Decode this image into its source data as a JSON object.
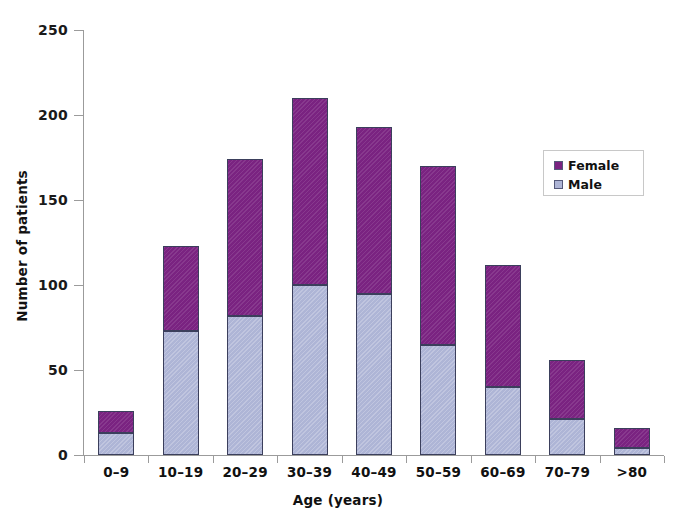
{
  "chart_data": {
    "type": "bar",
    "subtype": "stacked-vertical",
    "title": "",
    "xlabel": "Age (years)",
    "ylabel": "Number of patients",
    "categories": [
      "0–9",
      "10–19",
      "20–29",
      "30–39",
      "40–49",
      "50–59",
      "60–69",
      "70–79",
      ">80"
    ],
    "series": [
      {
        "name": "Male",
        "color": "#AEB5D6",
        "values": [
          13,
          73,
          82,
          100,
          95,
          65,
          40,
          21,
          4
        ]
      },
      {
        "name": "Female",
        "color": "#7A2381",
        "values": [
          13,
          50,
          92,
          110,
          98,
          105,
          72,
          35,
          12
        ]
      }
    ],
    "totals": [
      26,
      123,
      174,
      210,
      193,
      170,
      112,
      56,
      16
    ],
    "ylim": [
      0,
      250
    ],
    "yticks": [
      0,
      50,
      100,
      150,
      200,
      250
    ],
    "ytick_labels": [
      "0",
      "50",
      "100",
      "150",
      "200",
      "250"
    ],
    "grid": false,
    "legend_position": "right-middle",
    "legend_entries": [
      "Female",
      "Male"
    ],
    "stack_order": [
      "Male",
      "Female"
    ]
  },
  "axes": {
    "y_title": "Number of patients",
    "x_title": "Age (years)",
    "y_tick_labels": [
      "250",
      "200",
      "150",
      "100",
      "50",
      "0"
    ],
    "x_tick_labels": [
      "0–9",
      "10–19",
      "20–29",
      "30–39",
      "40–49",
      "50–59",
      "60–69",
      "70–79",
      ">80"
    ]
  },
  "legend": {
    "items": [
      {
        "label": "Female",
        "color": "#7A2381"
      },
      {
        "label": "Male",
        "color": "#AEB5D6"
      }
    ]
  },
  "colors": {
    "female": "#7A2381",
    "male": "#AEB5D6",
    "axis": "#9B9B9B",
    "bar_outline": "#3B3F5C",
    "text": "#111111",
    "background": "#FFFFFF"
  }
}
